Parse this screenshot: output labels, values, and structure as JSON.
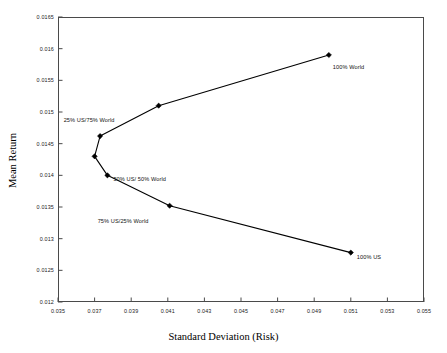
{
  "chart_data": {
    "type": "line",
    "title": "",
    "xlabel": "Standard Deviation (Risk)",
    "ylabel": "Mean Return",
    "xlim": [
      0.035,
      0.055
    ],
    "ylim": [
      0.012,
      0.0165
    ],
    "xticks": [
      "0.035",
      "0.037",
      "0.039",
      "0.041",
      "0.043",
      "0.045",
      "0.047",
      "0.049",
      "0.051",
      "0.053",
      "0.055"
    ],
    "yticks": [
      "0.012",
      "0.0125",
      "0.013",
      "0.0135",
      "0.014",
      "0.0145",
      "0.015",
      "0.0155",
      "0.016",
      "0.0165"
    ],
    "grid": false,
    "legend": "none",
    "marker": "filled-diamond",
    "line_color": "#000000",
    "points": [
      {
        "x": 0.0498,
        "y": 0.0159,
        "label": "100% World",
        "label_dx": 4,
        "label_dy": 9
      },
      {
        "x": 0.0405,
        "y": 0.0151,
        "label": "25% US/75% World",
        "label_dx": -95,
        "label_dy": 11
      },
      {
        "x": 0.0373,
        "y": 0.01462,
        "label": "",
        "label_dx": 0,
        "label_dy": 0
      },
      {
        "x": 0.037,
        "y": 0.0143,
        "label": "",
        "label_dx": 0,
        "label_dy": 0
      },
      {
        "x": 0.0377,
        "y": 0.014,
        "label": "50% US/ 50% World",
        "label_dx": 6,
        "label_dy": 1
      },
      {
        "x": 0.0411,
        "y": 0.01352,
        "label": "75% US/25% World",
        "label_dx": -72,
        "label_dy": 12
      },
      {
        "x": 0.051,
        "y": 0.01278,
        "label": "100% US",
        "label_dx": 6,
        "label_dy": 1
      }
    ]
  }
}
